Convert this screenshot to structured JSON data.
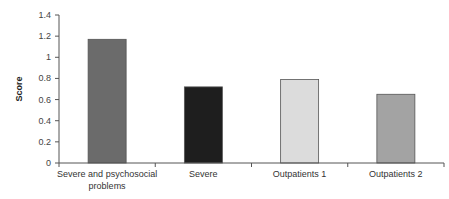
{
  "chart_data": {
    "type": "bar",
    "title": "",
    "xlabel": "",
    "ylabel": "Score",
    "ylim": [
      0,
      1.4
    ],
    "yticks": [
      "0",
      "0.2",
      "0.4",
      "0.6",
      "0.8",
      "1",
      "1.2",
      "1.4"
    ],
    "grid": false,
    "legend": null,
    "categories": [
      "Severe and psychosocial problems",
      "Severe",
      "Outpatients 1",
      "Outpatients 2"
    ],
    "category_label_lines": [
      [
        "Severe and psychosocial",
        "problems"
      ],
      [
        "Severe"
      ],
      [
        "Outpatients 1"
      ],
      [
        "Outpatients 2"
      ]
    ],
    "values": [
      1.17,
      0.72,
      0.79,
      0.65
    ],
    "bar_colors": [
      "#6b6b6b",
      "#1e1e1e",
      "#dcdcdc",
      "#a3a3a3"
    ]
  }
}
